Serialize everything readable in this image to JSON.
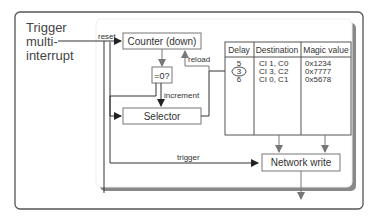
{
  "diagram": {
    "input_label": [
      "Trigger",
      "multi-",
      "interrupt"
    ],
    "blocks": {
      "counter": "Counter (down)",
      "compare": "=0?",
      "selector": "Selector",
      "network_write": "Network write"
    },
    "edge_labels": {
      "reset": "reset",
      "reload": "reload",
      "increment": "increment",
      "trigger": "trigger"
    },
    "table": {
      "headers": [
        "Delay",
        "Destination",
        "Magic value"
      ],
      "rows": [
        {
          "delay": "5",
          "destination": "CI 1, C0",
          "magic": "0x1234",
          "selected": false
        },
        {
          "delay": "3",
          "destination": "CI 3, C2",
          "magic": "0x7777",
          "selected": true
        },
        {
          "delay": "6",
          "destination": "CI 0, C1",
          "magic": "0x5678",
          "selected": false
        }
      ]
    },
    "colors": {
      "outer_frame": "#555555",
      "inner_shadow": "#888888",
      "box_border": "#777777",
      "text": "#333333",
      "arrow_gray": "#777777",
      "arrow_dark": "#222222"
    }
  }
}
